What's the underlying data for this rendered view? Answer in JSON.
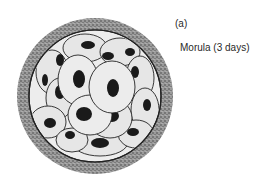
{
  "panel_label": "(a)",
  "caption": "Morula (3 days)",
  "colors": {
    "background": "#ffffff",
    "zona_pellucida": "#8a8a8a",
    "cell_fill": "#e8e8e8",
    "nucleus": "#1a1a1a",
    "outline": "#222222"
  }
}
